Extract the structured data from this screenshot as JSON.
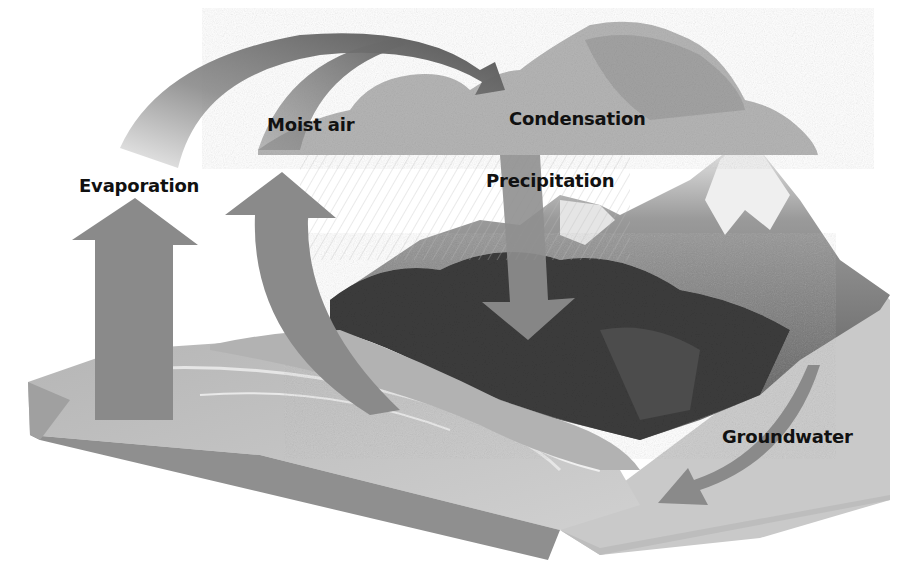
{
  "diagram": {
    "style": "grayscale block diagram",
    "labels": {
      "evaporation": "Evaporation",
      "moist_air": "Moist air",
      "condensation": "Condensation",
      "precipitation": "Precipitation",
      "groundwater": "Groundwater"
    },
    "elements": [
      {
        "id": "ocean",
        "description": "Ocean block with cut-away side"
      },
      {
        "id": "land",
        "description": "Forested land with snow-capped mountains"
      },
      {
        "id": "cloud",
        "description": "Cumulus cloud with rain streaks"
      },
      {
        "id": "evaporation-arrow",
        "description": "Large arrow rising from ocean, curving over to cloud"
      },
      {
        "id": "moist-air-arrow",
        "description": "Arrow rising from shoreline, curving into cloud"
      },
      {
        "id": "precipitation-arrow",
        "description": "Arrow descending from cloud onto land"
      },
      {
        "id": "groundwater-arrow",
        "description": "Curved arrow flowing underground toward ocean"
      }
    ],
    "colors": {
      "arrow": "#8a8a8a",
      "arrow_dark": "#5a5a5a",
      "cloud": "#b8b8b8",
      "mountain": "#6e6e6e",
      "forest": "#3a3a3a",
      "ocean_top": "#a9a9a9",
      "ocean_side": "#8c8c8c",
      "ground_side": "#c4c4c4",
      "text": "#111111"
    }
  }
}
